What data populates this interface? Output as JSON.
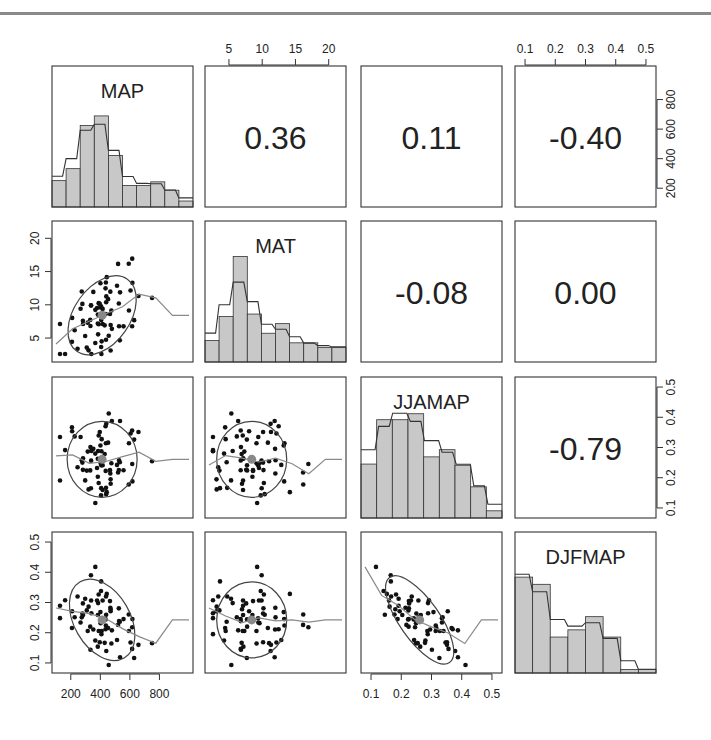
{
  "chart_data": {
    "type": "scatter-matrix",
    "title": "",
    "variables": [
      "MAP",
      "MAT",
      "JJAMAP",
      "DJFMAP"
    ],
    "correlations": [
      {
        "row": 0,
        "col": 1,
        "pair": "MAP-MAT",
        "value": "0.36"
      },
      {
        "row": 0,
        "col": 2,
        "pair": "MAP-JJAMAP",
        "value": "0.11"
      },
      {
        "row": 0,
        "col": 3,
        "pair": "MAP-DJFMAP",
        "value": "-0.40"
      },
      {
        "row": 1,
        "col": 2,
        "pair": "MAT-JJAMAP",
        "value": "-0.08"
      },
      {
        "row": 1,
        "col": 3,
        "pair": "MAT-DJFMAP",
        "value": "0.00"
      },
      {
        "row": 2,
        "col": 3,
        "pair": "JJAMAP-DJFMAP",
        "value": "-0.79"
      }
    ],
    "axes": {
      "MAP": {
        "range": [
          100,
          1000
        ],
        "ticks": [
          "200",
          "400",
          "600",
          "800"
        ]
      },
      "MAT": {
        "range": [
          2,
          22
        ],
        "ticks": [
          "5",
          "10",
          "15",
          "20"
        ]
      },
      "JJAMAP": {
        "range": [
          0.08,
          0.52
        ],
        "ticks": [
          "0.1",
          "0.2",
          "0.3",
          "0.4",
          "0.5"
        ]
      },
      "DJFMAP": {
        "range": [
          0.08,
          0.52
        ],
        "ticks": [
          "0.1",
          "0.2",
          "0.3",
          "0.4",
          "0.5"
        ]
      }
    },
    "histograms": {
      "MAP": [
        0.22,
        0.32,
        0.68,
        0.76,
        0.43,
        0.18,
        0.18,
        0.21,
        0.14,
        0.05
      ],
      "MAT": [
        0.18,
        0.38,
        0.88,
        0.4,
        0.24,
        0.32,
        0.16,
        0.16,
        0.12,
        0.12
      ],
      "JJAMAP": [
        0.45,
        0.82,
        0.82,
        0.87,
        0.51,
        0.57,
        0.44,
        0.26,
        0.06
      ],
      "DJFMAP": [
        0.8,
        0.74,
        0.3,
        0.36,
        0.47,
        0.3,
        0.03,
        0.03
      ]
    },
    "means": {
      "MAP": 480,
      "MAT": 10,
      "JJAMAP": 0.28,
      "DJFMAP": 0.23
    },
    "grid": false,
    "legend": "none"
  },
  "colors": {
    "frame": "#333333",
    "bar_fill": "#c8c8c8",
    "bar_stroke": "#333333",
    "point": "#111111",
    "mean_point": "#888888",
    "smooth_line": "#8a8a8a",
    "ellipse": "#444444",
    "top_rule": "#8a8a8a"
  }
}
